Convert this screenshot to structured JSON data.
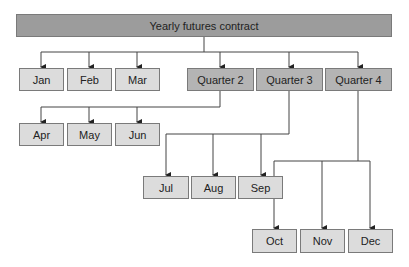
{
  "title": "Yearly futures contract",
  "level1": [
    {
      "label": "Jan"
    },
    {
      "label": "Feb"
    },
    {
      "label": "Mar"
    },
    {
      "label": "Quarter 2"
    },
    {
      "label": "Quarter 3"
    },
    {
      "label": "Quarter 4"
    }
  ],
  "quarter2_children": [
    {
      "label": "Apr"
    },
    {
      "label": "May"
    },
    {
      "label": "Jun"
    }
  ],
  "quarter3_children": [
    {
      "label": "Jul"
    },
    {
      "label": "Aug"
    },
    {
      "label": "Sep"
    }
  ],
  "quarter4_children": [
    {
      "label": "Oct"
    },
    {
      "label": "Nov"
    },
    {
      "label": "Dec"
    }
  ],
  "colors": {
    "root": "#9c9c9c",
    "quarter": "#b4b4b4",
    "month": "#dcdcdc",
    "line": "#333333"
  }
}
